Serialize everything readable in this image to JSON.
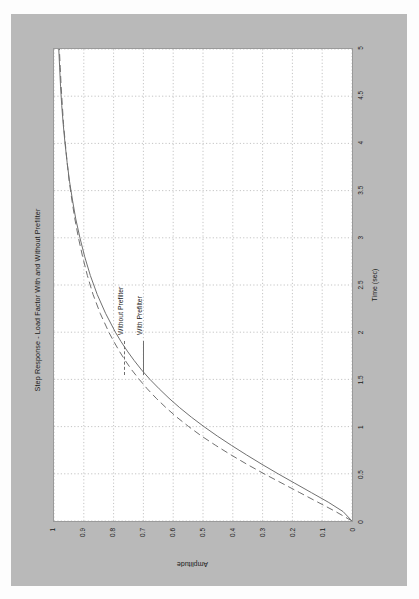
{
  "page": {
    "background_color": "#fdfdfd",
    "sheet_color": "#b9b9b9",
    "plot_background": "#ffffff",
    "orientation": "landscape-figure-rotated-90-on-portrait-page"
  },
  "chart_data": {
    "type": "line",
    "title": "Step Response - Load Factor With and Without Prefilter",
    "xlabel": "Time (sec)",
    "ylabel": "Amplitude",
    "xlim": [
      0,
      5
    ],
    "ylim": [
      0,
      1
    ],
    "xticks": [
      "0",
      "0.5",
      "1",
      "1.5",
      "2",
      "2.5",
      "3",
      "3.5",
      "4",
      "4.5",
      "5"
    ],
    "xtick_values": [
      0,
      0.5,
      1,
      1.5,
      2,
      2.5,
      3,
      3.5,
      4,
      4.5,
      5
    ],
    "yticks": [
      "0",
      "0.1",
      "0.2",
      "0.3",
      "0.4",
      "0.5",
      "0.6",
      "0.7",
      "0.8",
      "0.9",
      "1"
    ],
    "ytick_values": [
      0,
      0.1,
      0.2,
      0.3,
      0.4,
      0.5,
      0.6,
      0.7,
      0.8,
      0.9,
      1
    ],
    "grid": true,
    "grid_style": "dotted",
    "grid_color": "#b5b5b5",
    "legend_position": "upper-left-inside",
    "line_color": "#6f6f6f",
    "series": [
      {
        "name": "Without Prefilter",
        "style": "dashed",
        "x": [
          0,
          0.1,
          0.2,
          0.3,
          0.4,
          0.5,
          0.6,
          0.7,
          0.8,
          0.9,
          1.0,
          1.1,
          1.2,
          1.3,
          1.4,
          1.5,
          1.6,
          1.7,
          1.8,
          1.9,
          2.0,
          2.2,
          2.4,
          2.6,
          2.8,
          3.0,
          3.2,
          3.4,
          3.6,
          3.8,
          4.0,
          4.2,
          4.4,
          4.6,
          4.8,
          5.0
        ],
        "values": [
          0.0,
          0.055,
          0.115,
          0.175,
          0.235,
          0.295,
          0.352,
          0.406,
          0.457,
          0.505,
          0.548,
          0.588,
          0.624,
          0.657,
          0.687,
          0.714,
          0.739,
          0.761,
          0.781,
          0.799,
          0.816,
          0.845,
          0.869,
          0.888,
          0.904,
          0.918,
          0.93,
          0.94,
          0.949,
          0.956,
          0.962,
          0.968,
          0.972,
          0.976,
          0.979,
          0.982
        ]
      },
      {
        "name": "With Prefilter",
        "style": "solid",
        "x": [
          0,
          0.1,
          0.2,
          0.3,
          0.4,
          0.5,
          0.6,
          0.7,
          0.8,
          0.9,
          1.0,
          1.1,
          1.2,
          1.3,
          1.4,
          1.5,
          1.6,
          1.7,
          1.8,
          1.9,
          2.0,
          2.2,
          2.4,
          2.6,
          2.8,
          3.0,
          3.2,
          3.4,
          3.6,
          3.8,
          4.0,
          4.2,
          4.4,
          4.6,
          4.8,
          5.0
        ],
        "values": [
          0.0,
          0.03,
          0.08,
          0.136,
          0.192,
          0.248,
          0.302,
          0.354,
          0.404,
          0.452,
          0.497,
          0.539,
          0.578,
          0.614,
          0.647,
          0.678,
          0.706,
          0.731,
          0.754,
          0.775,
          0.794,
          0.827,
          0.855,
          0.878,
          0.897,
          0.913,
          0.927,
          0.938,
          0.948,
          0.956,
          0.963,
          0.969,
          0.974,
          0.978,
          0.981,
          0.984
        ]
      }
    ]
  }
}
